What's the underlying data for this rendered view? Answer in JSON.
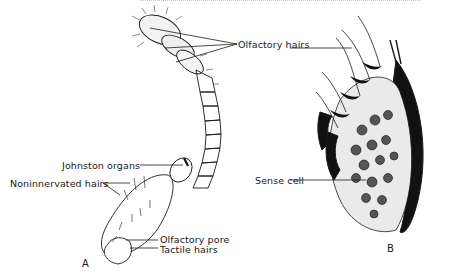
{
  "figure": {
    "panels": [
      {
        "id": "A",
        "label": "A",
        "subject": "insect antenna"
      },
      {
        "id": "B",
        "label": "B",
        "subject": "sensory epithelium section"
      }
    ],
    "labels": {
      "olfactory_hairs": "Olfactory hairs",
      "johnston_organs": "Johnston organs",
      "noninnervated_hairs": "Noninnervated hairs",
      "olfactory_pore": "Olfactory pore",
      "tactile_hairs": "Tactile hairs",
      "sense_cell": "Sense cell"
    },
    "colors": {
      "ink": "#1a1a1a",
      "background": "#ffffff"
    }
  }
}
